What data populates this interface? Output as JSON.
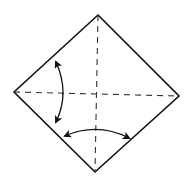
{
  "diagram": {
    "type": "origami-fold-step",
    "square": {
      "top": [
        98,
        15
      ],
      "right": [
        179,
        96
      ],
      "bottom": [
        95,
        172
      ],
      "left": [
        14,
        92
      ]
    },
    "creases": [
      {
        "name": "vertical-crease",
        "style": "dashed",
        "from": [
          98,
          15
        ],
        "to": [
          95,
          172
        ]
      },
      {
        "name": "horizontal-crease",
        "style": "dashed",
        "from": [
          14,
          92
        ],
        "to": [
          179,
          96
        ]
      }
    ],
    "arrows": [
      {
        "name": "left-fold-arrow",
        "type": "double-headed-curve",
        "from": [
          55,
          61
        ],
        "ctrl": [
          70,
          93
        ],
        "to": [
          55,
          123
        ]
      },
      {
        "name": "bottom-fold-arrow",
        "type": "double-headed-curve",
        "from": [
          64,
          136
        ],
        "ctrl": [
          97,
          122
        ],
        "to": [
          130,
          138
        ]
      }
    ],
    "colors": {
      "line": "#111111",
      "background": "#ffffff"
    }
  }
}
